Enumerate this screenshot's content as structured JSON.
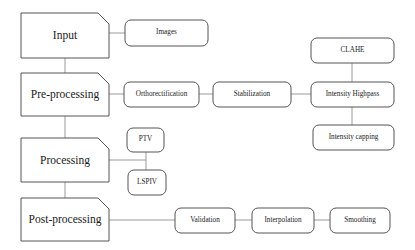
{
  "diagram": {
    "type": "flowchart",
    "colors": {
      "stroke": "#555555",
      "text": "#1a1a1a",
      "background": "#ffffff",
      "connector": "#9a9a9a"
    },
    "stage_nodes": [
      {
        "id": "input",
        "label": "Input",
        "x": 21,
        "y": 13,
        "w": 88,
        "h": 45,
        "shape": "cut-corner-rect"
      },
      {
        "id": "pre-processing",
        "label": "Pre-processing",
        "x": 21,
        "y": 73,
        "w": 88,
        "h": 43,
        "shape": "cut-corner-rect"
      },
      {
        "id": "processing",
        "label": "Processing",
        "x": 21,
        "y": 138,
        "w": 88,
        "h": 44,
        "shape": "cut-corner-rect"
      },
      {
        "id": "post-processing",
        "label": "Post-processing",
        "x": 21,
        "y": 198,
        "w": 88,
        "h": 43,
        "shape": "cut-corner-rect"
      }
    ],
    "sub_nodes": [
      {
        "id": "images",
        "label": "Images",
        "x": 125,
        "y": 20,
        "w": 83,
        "h": 26,
        "shape": "rounded-rect"
      },
      {
        "id": "orthorectification",
        "label": "Orthorectification",
        "x": 124,
        "y": 82,
        "w": 75,
        "h": 25,
        "shape": "rounded-rect"
      },
      {
        "id": "stabilization",
        "label": "Stabilization",
        "x": 213,
        "y": 82,
        "w": 78,
        "h": 25,
        "shape": "rounded-rect"
      },
      {
        "id": "clahe",
        "label": "CLAHE",
        "x": 311,
        "y": 38,
        "w": 83,
        "h": 25,
        "shape": "rounded-rect"
      },
      {
        "id": "intensity-highpass",
        "label": "Intensity Highpass",
        "x": 311,
        "y": 82,
        "w": 83,
        "h": 25,
        "shape": "rounded-rect"
      },
      {
        "id": "intensity-capping",
        "label": "Intensity capping",
        "x": 313,
        "y": 125,
        "w": 81,
        "h": 25,
        "shape": "rounded-rect"
      },
      {
        "id": "ptv",
        "label": "PTV",
        "x": 127,
        "y": 128,
        "w": 37,
        "h": 24,
        "shape": "rounded-rect"
      },
      {
        "id": "lspiv",
        "label": "LSPIV",
        "x": 128,
        "y": 170,
        "w": 38,
        "h": 25,
        "shape": "rounded-rect"
      },
      {
        "id": "validation",
        "label": "Validation",
        "x": 175,
        "y": 208,
        "w": 60,
        "h": 25,
        "shape": "rounded-rect"
      },
      {
        "id": "interpolation",
        "label": "Interpolation",
        "x": 252,
        "y": 208,
        "w": 62,
        "h": 25,
        "shape": "rounded-rect"
      },
      {
        "id": "smoothing",
        "label": "Smoothing",
        "x": 330,
        "y": 208,
        "w": 60,
        "h": 25,
        "shape": "rounded-rect"
      }
    ],
    "connectors": [
      {
        "id": "input-to-pre",
        "from": "input",
        "to": "pre-processing",
        "points": "65,58 65,73"
      },
      {
        "id": "pre-to-processing",
        "from": "pre-processing",
        "to": "processing",
        "points": "65,116 65,138"
      },
      {
        "id": "processing-to-post",
        "from": "processing",
        "to": "post-processing",
        "points": "65,182 65,198"
      },
      {
        "id": "input-to-images",
        "from": "input",
        "to": "images",
        "points": "109,33 125,33"
      },
      {
        "id": "pre-to-orthorectification",
        "from": "pre-processing",
        "to": "orthorectification",
        "points": "109,94 124,94"
      },
      {
        "id": "ortho-to-stabilization",
        "from": "orthorectification",
        "to": "stabilization",
        "points": "199,94 213,94"
      },
      {
        "id": "stabilization-to-highpass",
        "from": "stabilization",
        "to": "intensity-highpass",
        "points": "291,94 311,94"
      },
      {
        "id": "clahe-to-highpass",
        "from": "clahe",
        "to": "intensity-highpass",
        "points": "352,63 352,82"
      },
      {
        "id": "highpass-to-capping",
        "from": "intensity-highpass",
        "to": "intensity-capping",
        "points": "352,107 352,125"
      },
      {
        "id": "processing-to-branch",
        "from": "processing",
        "to": "ptv-lspiv-branch",
        "points": "109,160 146,160"
      },
      {
        "id": "branch-to-ptv",
        "from": "ptv-lspiv-branch",
        "to": "ptv",
        "points": "146,152 146,170"
      },
      {
        "id": "post-to-validation",
        "from": "post-processing",
        "to": "validation",
        "points": "109,220 175,220"
      },
      {
        "id": "validation-to-interpolation",
        "from": "validation",
        "to": "interpolation",
        "points": "235,220 252,220"
      },
      {
        "id": "interpolation-to-smoothing",
        "from": "interpolation",
        "to": "smoothing",
        "points": "314,220 330,220"
      }
    ]
  }
}
